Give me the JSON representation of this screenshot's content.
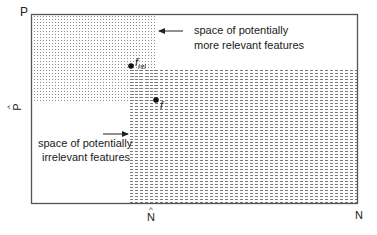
{
  "axes": {
    "y_top_label": "P",
    "y_hat_label": "P",
    "x_hat_label": "N",
    "x_right_label": "N"
  },
  "regions": {
    "relevant": {
      "label_line1": "space of potentially",
      "label_line2": "more relevant features",
      "pattern": "dotted"
    },
    "irrelevant": {
      "label_line1": "space of potentially",
      "label_line2": "irrelevant features",
      "pattern": "dashed"
    }
  },
  "points": {
    "f_rel": {
      "label": "f",
      "subscript": "rel"
    },
    "f": {
      "label": "f"
    }
  },
  "colors": {
    "border": "#555555",
    "pattern": "#8a8a8a",
    "dot": "#111111"
  }
}
